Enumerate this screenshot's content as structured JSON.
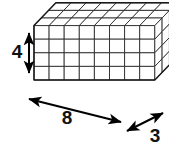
{
  "figure": {
    "type": "isometric-unit-cube-prism",
    "solid": {
      "length_cubes": 8,
      "depth_cubes": 3,
      "height_cubes": 4,
      "total_cubes": 96
    },
    "style": {
      "line_color": "#1a1a1a",
      "fill_color": "#ffffff",
      "background_color": "#ffffff",
      "arrow_color": "#000000",
      "label_color": "#111111"
    },
    "dimensions": [
      {
        "id": "height",
        "label": "4",
        "axis": "vertical",
        "arrow": "double-headed",
        "position": "left"
      },
      {
        "id": "length",
        "label": "8",
        "axis": "diagonal-down-right",
        "arrow": "double-headed",
        "position": "bottom-left"
      },
      {
        "id": "depth",
        "label": "3",
        "axis": "diagonal-up-right",
        "arrow": "double-headed",
        "position": "bottom-right"
      }
    ],
    "geometry": {
      "origin_x": 34,
      "origin_y": 80,
      "unit_x": 15.1,
      "unit_y": 13.6,
      "dx_depth_x": 7.3,
      "dx_depth_y": -7.6
    }
  }
}
